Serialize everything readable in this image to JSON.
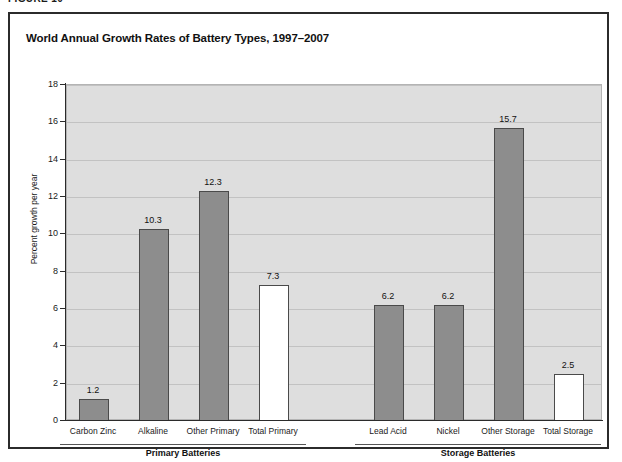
{
  "figure": {
    "caption": "FIGURE 10"
  },
  "chart_data": {
    "type": "bar",
    "title": "World Annual Growth Rates of Battery Types, 1997–2007",
    "xlabel": "",
    "ylabel": "Percent growth per year",
    "ylim": [
      0,
      18
    ],
    "ytick_step": 2,
    "ytick_labels": [
      "0",
      "2",
      "4",
      "6",
      "8",
      "10",
      "12",
      "14",
      "16",
      "18"
    ],
    "grid": true,
    "legend": "none",
    "categories": [
      "Carbon Zinc",
      "Alkaline",
      "Other Primary",
      "Total Primary",
      "Lead Acid",
      "Nickel",
      "Other Storage",
      "Total Storage"
    ],
    "values": [
      1.2,
      10.3,
      12.3,
      7.3,
      6.2,
      6.2,
      15.7,
      2.5
    ],
    "value_labels": [
      "1.2",
      "10.3",
      "12.3",
      "7.3",
      "6.2",
      "6.2",
      "15.7",
      "2.5"
    ],
    "bar_styles": [
      "filled",
      "filled",
      "filled",
      "hollow",
      "filled",
      "filled",
      "filled",
      "hollow"
    ],
    "groups": [
      {
        "label": "Primary Batteries",
        "categories": [
          "Carbon Zinc",
          "Alkaline",
          "Other Primary",
          "Total Primary"
        ]
      },
      {
        "label": "Storage Batteries",
        "categories": [
          "Lead Acid",
          "Nickel",
          "Other Storage",
          "Total Storage"
        ]
      }
    ],
    "colors": {
      "bar_fill": "#8d8d8d",
      "bar_hollow": "#ffffff",
      "bar_border": "#4a4a4a",
      "plot_background": "#dedede",
      "gridline": "#c2c2c2",
      "axis": "#2b2b2b",
      "text": "#111111"
    }
  }
}
